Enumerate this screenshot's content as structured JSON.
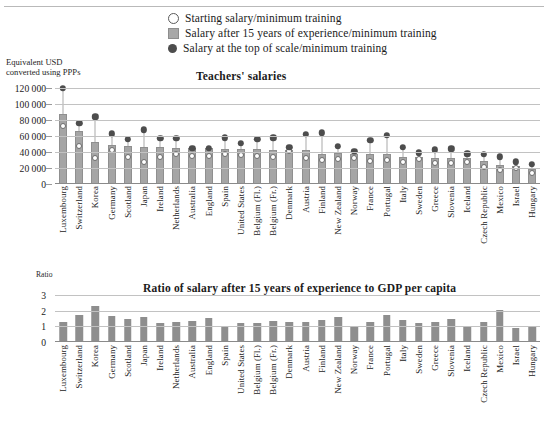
{
  "legend": {
    "items": [
      {
        "marker": "open-circle-marker",
        "label": "Starting salary/minimum training"
      },
      {
        "marker": "gray-square-marker",
        "label": "Salary after 15 years of experience/minimum training"
      },
      {
        "marker": "filled-circle-marker",
        "label": "Salary at the top of scale/minimum training"
      }
    ]
  },
  "chart_data": [
    {
      "type": "bar",
      "id": "teachers-salaries",
      "title": "Teachers' salaries",
      "ylabel": "Equivalent USD converted using PPPs",
      "xlabel": "",
      "ylim": [
        0,
        120000
      ],
      "yticks": [
        "0",
        "20 000",
        "40 000",
        "60 000",
        "80 000",
        "100 000",
        "120 000"
      ],
      "ytick_values": [
        0,
        20000,
        40000,
        60000,
        80000,
        100000,
        120000
      ],
      "grid": true,
      "legend_position": "top",
      "categories": [
        "Luxembourg",
        "Switzerland",
        "Korea",
        "Germany",
        "Scotland",
        "Japan",
        "Ireland",
        "Netherlands",
        "Australia",
        "England",
        "Spain",
        "United States",
        "Belgium (Fl.)",
        "Belgium (Fr.)",
        "Denmark",
        "Austria",
        "Finland",
        "New Zealand",
        "Norway",
        "France",
        "Portugal",
        "Italy",
        "Sweden",
        "Greece",
        "Slovenia",
        "Iceland",
        "Czech Republic",
        "Mexico",
        "Israel",
        "Hungary"
      ],
      "series": [
        {
          "name": "Salary after 15 years of experience/minimum training",
          "marker": "gray-square-marker",
          "values": [
            88000,
            66000,
            52000,
            49000,
            47000,
            46500,
            46000,
            45500,
            45000,
            44500,
            44000,
            44000,
            43500,
            43000,
            43000,
            42000,
            38000,
            39000,
            38000,
            37000,
            38000,
            34000,
            34000,
            33000,
            33000,
            32000,
            29000,
            24000,
            23000,
            19000
          ]
        },
        {
          "name": "Starting salary/minimum training",
          "marker": "open-circle-marker",
          "values": [
            72000,
            47000,
            32000,
            42000,
            34000,
            28000,
            34000,
            37000,
            35000,
            35000,
            37000,
            36000,
            35000,
            34000,
            41000,
            33000,
            30000,
            31000,
            33000,
            29000,
            30000,
            28000,
            31000,
            26000,
            26000,
            28000,
            21000,
            17000,
            20000,
            14000
          ]
        },
        {
          "name": "Salary at the top of scale/minimum training",
          "marker": "filled-circle-marker",
          "values": [
            120000,
            76000,
            84000,
            63000,
            56000,
            68000,
            57000,
            57000,
            45000,
            45000,
            58000,
            51000,
            56000,
            58000,
            46000,
            62000,
            64000,
            47000,
            41000,
            55000,
            61000,
            46000,
            39000,
            43000,
            44000,
            38000,
            37000,
            34000,
            28000,
            25000
          ]
        }
      ]
    },
    {
      "type": "bar",
      "id": "salary-to-gdp-ratio",
      "title": "Ratio of salary after 15 years of experience to GDP per capita",
      "ylabel": "Ratio",
      "xlabel": "",
      "ylim": [
        0,
        3
      ],
      "yticks": [
        "0",
        "1",
        "2",
        "3"
      ],
      "ytick_values": [
        0,
        1,
        2,
        3
      ],
      "grid": true,
      "categories": [
        "Luxembourg",
        "Switzerland",
        "Korea",
        "Germany",
        "Scotland",
        "Japan",
        "Ireland",
        "Netherlands",
        "Australia",
        "England",
        "Spain",
        "United States",
        "Belgium (Fl.)",
        "Belgium (Fr.)",
        "Denmark",
        "Austria",
        "Finland",
        "New Zealand",
        "Norway",
        "France",
        "Portugal",
        "Italy",
        "Sweden",
        "Greece",
        "Slovenia",
        "Iceland",
        "Czech Republic",
        "Mexico",
        "Israel",
        "Hungary"
      ],
      "values": [
        1.25,
        1.7,
        2.3,
        1.68,
        1.48,
        1.57,
        1.2,
        1.3,
        1.33,
        1.55,
        0.98,
        1.22,
        1.22,
        1.33,
        1.3,
        1.3,
        1.43,
        1.62,
        0.95,
        1.3,
        1.72,
        1.4,
        1.22,
        1.3,
        1.45,
        1.0,
        1.28,
        2.05,
        0.92,
        1.05
      ]
    }
  ]
}
